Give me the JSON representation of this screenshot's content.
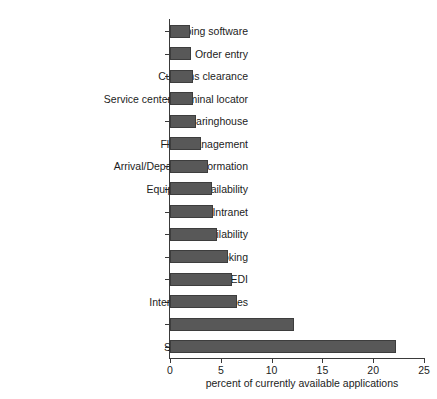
{
  "chart_data": {
    "type": "bar",
    "orientation": "horizontal",
    "title": "",
    "xlabel": "percent of currently available applications",
    "ylabel": "",
    "xlim": [
      0,
      25
    ],
    "xticks": [
      0,
      5,
      10,
      15,
      20,
      25
    ],
    "xticklabels": [
      "0",
      "5",
      "10",
      "15",
      "20",
      "25"
    ],
    "grid": false,
    "legend": false,
    "bar_color": "#585858",
    "bar_edge_color": "#3d3d3d",
    "categories": [
      "Shiping software",
      "Order entry",
      "Customs clearance",
      "Service center/Terminal locator",
      "Clearinghouse",
      "Fleet management",
      "Arrival/Departure information",
      "Equipment availability",
      "Extranet/Intranet",
      "Load availability",
      "Load booking",
      "EC/EDI",
      "Interactive schedules",
      "Quote request",
      "Shipment tracking"
    ],
    "values": [
      2.0,
      2.1,
      2.3,
      2.3,
      2.6,
      3.1,
      3.7,
      4.1,
      4.2,
      4.6,
      5.7,
      6.1,
      6.6,
      12.2,
      22.2
    ]
  }
}
